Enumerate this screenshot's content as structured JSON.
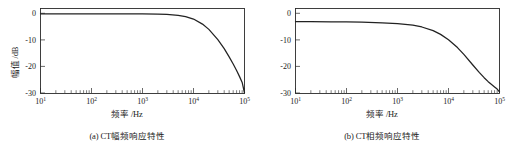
{
  "figure": {
    "panels": [
      {
        "id": "panel-a",
        "caption": "(a) CT幅频响应特性",
        "xlabel": "频率 /Hz",
        "ylabel": "幅值 /dB"
      },
      {
        "id": "panel-b",
        "caption": "(b) CT相频响应特性",
        "xlabel": "频率 /Hz",
        "ylabel": "相角 /(°)"
      }
    ],
    "axis_text": {
      "x_ticks": [
        "10",
        "10",
        "10",
        "10",
        "10"
      ],
      "x_exponents": [
        "1",
        "2",
        "3",
        "4",
        "5"
      ],
      "y_ticks_a": [
        "0",
        "-10",
        "-20",
        "-30"
      ],
      "y_ticks_b": [
        "0",
        "-10",
        "-20",
        "-30"
      ]
    },
    "colors": {
      "curve": "#222222",
      "frame": "#2a2a2a",
      "background": "#ffffff",
      "text": "#1a1a1a"
    }
  },
  "chart_data": [
    {
      "type": "line",
      "title": "(a) CT幅频响应特性",
      "xlabel": "频率 /Hz",
      "ylabel": "幅值 /dB",
      "xscale": "log",
      "xlim": [
        10,
        100000
      ],
      "ylim": [
        -30,
        2
      ],
      "yticks": [
        0,
        -10,
        -20,
        -30
      ],
      "xticks": [
        10,
        100,
        1000,
        10000,
        100000
      ],
      "grid": false,
      "legend": null,
      "series": [
        {
          "name": "CT magnitude response",
          "x": [
            10,
            20,
            50,
            100,
            200,
            500,
            1000,
            2000,
            3000,
            5000,
            7000,
            10000,
            15000,
            20000,
            30000,
            40000,
            50000,
            60000,
            70000,
            80000,
            90000,
            100000
          ],
          "y": [
            0.0,
            0.0,
            0.0,
            0.0,
            0.0,
            -0.02,
            -0.05,
            -0.12,
            -0.25,
            -0.6,
            -1.1,
            -2.0,
            -3.9,
            -5.9,
            -9.8,
            -13.2,
            -16.3,
            -19.0,
            -21.5,
            -23.8,
            -26.0,
            -30.0
          ]
        }
      ]
    },
    {
      "type": "line",
      "title": "(b) CT相频响应特性",
      "xlabel": "频率 /Hz",
      "ylabel": "相角 /(°)",
      "xscale": "log",
      "xlim": [
        10,
        100000
      ],
      "ylim": [
        -30,
        2
      ],
      "yticks": [
        0,
        -10,
        -20,
        -30
      ],
      "xticks": [
        10,
        100,
        1000,
        10000,
        100000
      ],
      "grid": false,
      "legend": null,
      "series": [
        {
          "name": "CT phase response",
          "x": [
            10,
            20,
            50,
            100,
            200,
            500,
            1000,
            2000,
            3000,
            5000,
            7000,
            10000,
            15000,
            20000,
            30000,
            40000,
            50000,
            60000,
            70000,
            80000,
            90000,
            100000
          ],
          "y": [
            -3.0,
            -3.0,
            -3.05,
            -3.1,
            -3.2,
            -3.4,
            -3.7,
            -4.3,
            -5.0,
            -6.4,
            -7.8,
            -9.8,
            -12.8,
            -15.4,
            -19.4,
            -22.2,
            -24.2,
            -25.7,
            -26.8,
            -27.7,
            -28.5,
            -29.6
          ]
        }
      ]
    }
  ]
}
